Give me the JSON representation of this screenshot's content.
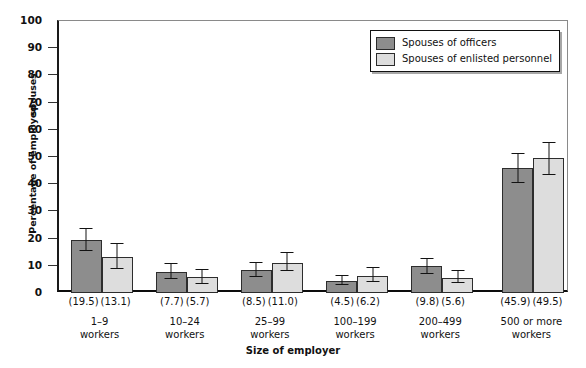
{
  "chart_data": {
    "type": "bar",
    "title": "",
    "xlabel": "Size of employer",
    "ylabel": "Percentage of employed spouses",
    "ylabel_part_a": "Percentage of employed",
    "ylabel_part_b": "spouses",
    "ylim": [
      0,
      100
    ],
    "ytick_step": 10,
    "ytick_labels": [
      "100",
      "90",
      "80",
      "70",
      "60",
      "50",
      "40",
      "30",
      "20",
      "10",
      "0"
    ],
    "grid": false,
    "legend_position": "top-right",
    "categories": [
      "1–9 workers",
      "10–24 workers",
      "25–99 workers",
      "100–199 workers",
      "200–499 workers",
      "500 or more workers"
    ],
    "category_lines": [
      [
        "1–9",
        "workers"
      ],
      [
        "10–24",
        "workers"
      ],
      [
        "25–99",
        "workers"
      ],
      [
        "100–199",
        "workers"
      ],
      [
        "200–499",
        "workers"
      ],
      [
        "500 or more",
        "workers"
      ]
    ],
    "series": [
      {
        "name": "Spouses of officers",
        "color": "#8d8d8d",
        "values": [
          19.5,
          7.7,
          8.5,
          4.5,
          9.8,
          45.9
        ],
        "value_labels": [
          "(19.5)",
          "(7.7)",
          "(8.5)",
          "(4.5)",
          "(9.8)",
          "(45.9)"
        ],
        "error_low": [
          15.5,
          5.2,
          6.0,
          2.8,
          7.0,
          40.5
        ],
        "error_high": [
          24.0,
          11.0,
          11.5,
          6.5,
          13.0,
          51.5
        ]
      },
      {
        "name": "Spouses of enlisted personnel",
        "color": "#dddddd",
        "values": [
          13.1,
          5.7,
          11.0,
          6.2,
          5.6,
          49.5
        ],
        "value_labels": [
          "(13.1)",
          "(5.7)",
          "(11.0)",
          "(6.2)",
          "(5.6)",
          "(49.5)"
        ],
        "error_low": [
          9.0,
          3.4,
          8.0,
          4.0,
          3.6,
          43.5
        ],
        "error_high": [
          18.5,
          9.0,
          15.0,
          9.5,
          8.5,
          55.5
        ]
      }
    ]
  },
  "legend": {
    "items": [
      {
        "label": "Spouses of officers",
        "color": "#8d8d8d"
      },
      {
        "label": "Spouses of enlisted personnel",
        "color": "#dddddd"
      }
    ]
  },
  "axes": {
    "x_title": "Size of employer",
    "y_title": "Percentage of employed spouses"
  }
}
